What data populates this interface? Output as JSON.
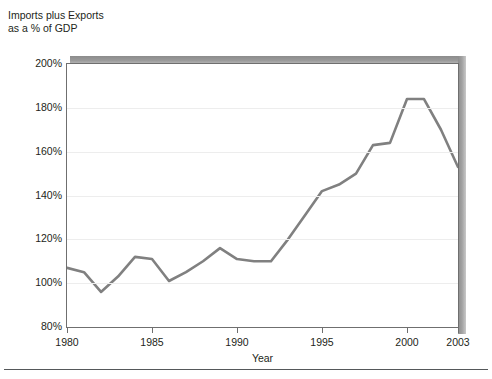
{
  "chart_data": {
    "type": "line",
    "title": "Imports plus Exports\nas a % of GDP",
    "xlabel": "Year",
    "ylabel": "",
    "x": [
      1980,
      1981,
      1982,
      1983,
      1984,
      1985,
      1986,
      1987,
      1988,
      1989,
      1990,
      1991,
      1992,
      1993,
      1994,
      1995,
      1996,
      1997,
      1998,
      1999,
      2000,
      2001,
      2002,
      2003
    ],
    "values": [
      107,
      105,
      96,
      103,
      112,
      111,
      101,
      105,
      110,
      116,
      111,
      110,
      110,
      120,
      131,
      142,
      145,
      150,
      163,
      164,
      184,
      184,
      170,
      153
    ],
    "series": [
      {
        "name": "Imports plus Exports as a % of GDP",
        "values": [
          107,
          105,
          96,
          103,
          112,
          111,
          101,
          105,
          110,
          116,
          111,
          110,
          110,
          120,
          131,
          142,
          145,
          150,
          163,
          164,
          184,
          184,
          170,
          153
        ]
      }
    ],
    "xlim": [
      1980,
      2003
    ],
    "ylim": [
      80,
      200
    ],
    "ytick_values": [
      80,
      100,
      120,
      140,
      160,
      180,
      200
    ],
    "ytick_labels": [
      "80%",
      "100%",
      "120%",
      "140%",
      "160%",
      "180%",
      "200%"
    ],
    "xtick_values": [
      1980,
      1985,
      1990,
      1995,
      2000,
      2003
    ],
    "xtick_labels": [
      "1980",
      "1985",
      "1990",
      "1995",
      "2000",
      "2003"
    ],
    "grid": true,
    "grid_axis": "y",
    "legend": false,
    "legend_position": "none",
    "line_color": "#808080",
    "line_width": 2.6,
    "markers": false,
    "gridline_color": "#ededed",
    "axis_color": "#6f6f6f",
    "text_color": "#231f20",
    "background_color": "#ffffff",
    "shadow_color": "#8c8c8c"
  }
}
